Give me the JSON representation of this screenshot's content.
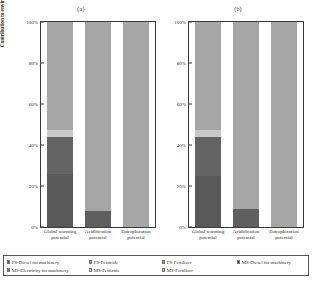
{
  "figure": {
    "ylabel": "Contribution to environmental impact (%)",
    "panels": [
      {
        "title": "(a)"
      },
      {
        "title": "(b)"
      }
    ]
  },
  "chart_data": {
    "type": "bar",
    "subtype": "stacked-percentage",
    "title": "",
    "xlabel": "",
    "ylabel": "Contribution to environmental impact (%)",
    "ylim": [
      0,
      100
    ],
    "yticks": [
      "0%",
      "20%",
      "40%",
      "60%",
      "80%",
      "100%"
    ],
    "ytick_values": [
      0,
      20,
      40,
      60,
      80,
      100
    ],
    "grid": false,
    "legend_position": "bottom",
    "categories": [
      "Global warming potential",
      "Acidification potential",
      "Eutrophication potential"
    ],
    "series": [
      {
        "name": "FS-Diesel for machinery",
        "color": "#595959"
      },
      {
        "name": "FS-Pesticide",
        "color": "#a6a6a6"
      },
      {
        "name": "FS-Fertilizer",
        "color": "#8c8c8c"
      },
      {
        "name": "MS-Diesel for machinery",
        "color": "#404040"
      },
      {
        "name": "MS-Electricity for machinery",
        "color": "#737373"
      },
      {
        "name": "MS-Pesticide",
        "color": "#d9d9d9"
      },
      {
        "name": "MS-Fertilizer",
        "color": "#a6a6a6"
      }
    ],
    "panels": [
      {
        "title": "(a)",
        "bars": [
          {
            "category": "Global warming potential",
            "segments": [
              {
                "series": "FS-Diesel for machinery",
                "value": 26.0,
                "color": "#595959"
              },
              {
                "series": "MS-Electricity for machinery",
                "value": 18.0,
                "color": "#646464"
              },
              {
                "series": "MS-Pesticide",
                "value": 3.5,
                "color": "#c9c9c9"
              },
              {
                "series": "MS-Fertilizer",
                "value": 52.5,
                "color": "#a6a6a6"
              }
            ]
          },
          {
            "category": "Acidification potential",
            "segments": [
              {
                "series": "FS-Diesel for machinery",
                "value": 8.0,
                "color": "#5f5f5f"
              },
              {
                "series": "MS-Fertilizer",
                "value": 92.0,
                "color": "#a6a6a6"
              }
            ]
          },
          {
            "category": "Eutrophication potential",
            "segments": [
              {
                "series": "MS-Fertilizer",
                "value": 100.0,
                "color": "#a6a6a6"
              }
            ]
          }
        ]
      },
      {
        "title": "(b)",
        "bars": [
          {
            "category": "Global warming potential",
            "segments": [
              {
                "series": "FS-Diesel for machinery",
                "value": 25.0,
                "color": "#595959"
              },
              {
                "series": "MS-Electricity for machinery",
                "value": 19.0,
                "color": "#646464"
              },
              {
                "series": "MS-Pesticide",
                "value": 3.5,
                "color": "#c9c9c9"
              },
              {
                "series": "MS-Fertilizer",
                "value": 52.5,
                "color": "#a6a6a6"
              }
            ]
          },
          {
            "category": "Acidification potential",
            "segments": [
              {
                "series": "FS-Diesel for machinery",
                "value": 9.0,
                "color": "#5f5f5f"
              },
              {
                "series": "MS-Fertilizer",
                "value": 91.0,
                "color": "#a6a6a6"
              }
            ]
          },
          {
            "category": "Eutrophication potential",
            "segments": [
              {
                "series": "MS-Fertilizer",
                "value": 100.0,
                "color": "#a6a6a6"
              }
            ]
          }
        ]
      }
    ]
  },
  "legend": {
    "rows": [
      [
        {
          "label": "FS-Diesel for machinery",
          "color": "#595959"
        },
        {
          "label": "FS-Pesticide",
          "color": "#a6a6a6"
        },
        {
          "label": "FS-Fertilizer",
          "color": "#8c8c8c"
        },
        {
          "label": "MS-Diesel for machinery",
          "color": "#404040"
        }
      ],
      [
        {
          "label": "MS-Electricity for machinery",
          "color": "#737373"
        },
        {
          "label": "MS-Pesticide",
          "color": "#d9d9d9"
        },
        {
          "label": "MS-Fertilizer",
          "color": "#a6a6a6"
        }
      ]
    ]
  }
}
